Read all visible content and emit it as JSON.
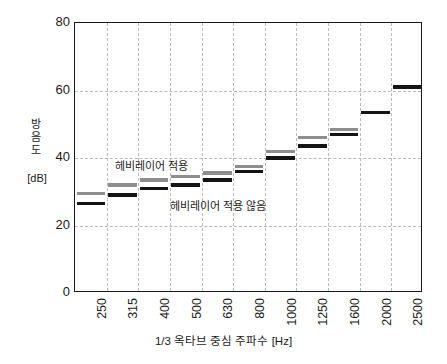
{
  "chart_data": {
    "type": "bar",
    "title": "",
    "subtitle": "",
    "xlabel": "1/3 옥타브 중심 주파수 [Hz]",
    "ylabel": "방음도",
    "ylabel_unit": "[dB]",
    "ylabel_chars": [
      "방",
      "음",
      "도"
    ],
    "categories": [
      "250",
      "315",
      "400",
      "500",
      "630",
      "800",
      "1000",
      "1250",
      "1600",
      "2000",
      "2500"
    ],
    "xlim": [
      0,
      11
    ],
    "ylim": [
      0,
      80
    ],
    "yticks": [
      0,
      20,
      40,
      60,
      80
    ],
    "ytick_labels": [
      "0",
      "20",
      "40",
      "60",
      "80"
    ],
    "grid": true,
    "grid_style": "dashed",
    "legend": "annotations-inline",
    "series": [
      {
        "name": "헤비레이어 적용",
        "color": "#8e8e8e",
        "values": [
          29.5,
          32.0,
          33.5,
          34.5,
          35.5,
          37.5,
          42.0,
          46.0,
          48.5,
          53.5,
          61.0
        ]
      },
      {
        "name": "헤비레이어 적용 않음",
        "color": "#141414",
        "values": [
          26.5,
          29.0,
          31.0,
          32.0,
          33.5,
          36.0,
          40.0,
          43.5,
          47.0,
          53.5,
          61.0
        ]
      }
    ],
    "annotations": [
      {
        "text": "헤비레이어 적용",
        "target": "series-0"
      },
      {
        "text": "헤비레이어 적용 않음",
        "target": "series-1"
      }
    ]
  }
}
